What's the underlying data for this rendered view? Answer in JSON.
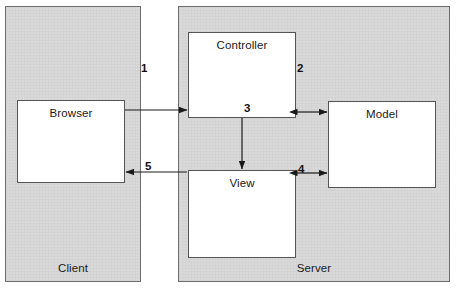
{
  "diagram": {
    "colors": {
      "zone_fill": "#d9d9d9",
      "zone_border": "#6e6e6e",
      "node_fill": "#ffffff",
      "node_border": "#555555",
      "arrow": "#1a1a1a",
      "text": "#1a1a1a",
      "background": "#ffffff"
    },
    "zones": [
      {
        "id": "client",
        "label": "Client",
        "x": 5,
        "y": 6,
        "w": 136,
        "h": 276,
        "label_y": 262
      },
      {
        "id": "server",
        "label": "Server",
        "x": 178,
        "y": 6,
        "w": 272,
        "h": 276,
        "label_y": 262
      }
    ],
    "nodes": [
      {
        "id": "browser",
        "label": "Browser",
        "x": 17,
        "y": 100,
        "w": 108,
        "h": 83
      },
      {
        "id": "controller",
        "label": "Controller",
        "x": 188,
        "y": 32,
        "w": 108,
        "h": 86
      },
      {
        "id": "view",
        "label": "View",
        "x": 188,
        "y": 170,
        "w": 108,
        "h": 88
      },
      {
        "id": "model",
        "label": "Model",
        "x": 328,
        "y": 101,
        "w": 108,
        "h": 87
      }
    ],
    "edges": [
      {
        "id": "edge-1",
        "label": "1",
        "from": "browser",
        "to": "controller",
        "kind": "horizontal",
        "direction": "forward",
        "label_x": 141,
        "label_y": 62
      },
      {
        "id": "edge-2",
        "label": "2",
        "from": "controller",
        "to": "model",
        "kind": "horizontal",
        "direction": "both",
        "label_x": 297,
        "label_y": 62
      },
      {
        "id": "edge-3",
        "label": "3",
        "from": "controller",
        "to": "view",
        "kind": "vertical",
        "direction": "forward",
        "label_x": 244,
        "label_y": 102
      },
      {
        "id": "edge-4",
        "label": "4",
        "from": "view",
        "to": "model",
        "kind": "horizontal",
        "direction": "both",
        "label_x": 298,
        "label_y": 163
      },
      {
        "id": "edge-5",
        "label": "5",
        "from": "view",
        "to": "browser",
        "kind": "horizontal",
        "direction": "backward",
        "label_x": 145,
        "label_y": 160
      }
    ]
  }
}
